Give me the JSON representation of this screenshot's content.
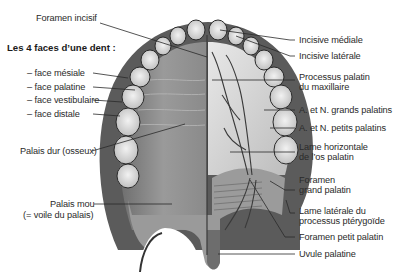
{
  "diagram": {
    "heading": "Les 4 faces d’une dent :",
    "left_labels": {
      "foramen_incisif": "Foramen incisif",
      "face_mesiale": "– face mésiale",
      "face_palatine": "– face palatine",
      "face_vestibulaire": "– face vestibulaire",
      "face_distale": "– face distale",
      "palais_dur": "Palais dur (osseux)",
      "palais_mou_1": "Palais mou",
      "palais_mou_2": "(= voile du palais)"
    },
    "right_labels": {
      "incisive_mediale": "Incisive médiale",
      "incisive_laterale": "Incisive latérale",
      "processus_palatin_1": "Processus palatin",
      "processus_palatin_2": "du maxillaire",
      "grands_palatins": "A. et N. grands palatins",
      "petits_palatins": "A. et N. petits palatins",
      "lame_horizontale_1": "Lame horizontale",
      "lame_horizontale_2": "de l’os palatin",
      "foramen_grand_1": "Foramen",
      "foramen_grand_2": "grand palatin",
      "lame_laterale_1": "Lame latérale du",
      "lame_laterale_2": "processus ptérygoïde",
      "foramen_petit": "Foramen petit palatin",
      "uvule": "Uvule palatine"
    },
    "colors": {
      "ink": "#2a2a2a",
      "mucosa": "#8a8a8a",
      "bone": "#d8d8d8",
      "tooth": "#e6e6e6"
    }
  }
}
